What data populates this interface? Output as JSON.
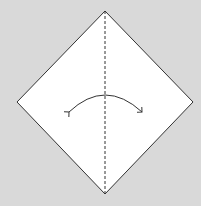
{
  "diagram": {
    "type": "origami-fold-step",
    "background_color": "#d9d9d9",
    "paper_color": "#ffffff",
    "line_color": "#333333",
    "shape": "square-rotated-diamond",
    "vertices": {
      "top": [
        105,
        11
      ],
      "left": [
        17,
        102
      ],
      "right": [
        193,
        102
      ],
      "bottom": [
        105,
        194
      ]
    },
    "crease": {
      "style": "dashed",
      "orientation": "vertical",
      "label": "valley fold"
    },
    "arrow": {
      "type": "fold-and-unfold",
      "direction": "left-right",
      "label": "fold and unfold"
    }
  }
}
